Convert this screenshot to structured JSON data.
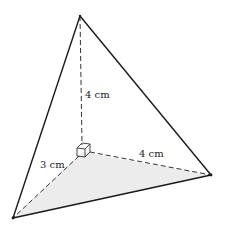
{
  "diagram": {
    "type": "triangular-pyramid",
    "vertices": {
      "apex": [
        80,
        16
      ],
      "corner": [
        82,
        152
      ],
      "bottom_left": [
        13,
        218
      ],
      "right": [
        211,
        175
      ]
    },
    "colors": {
      "edge": "#1a1a1a",
      "dashed_edge": "#333333",
      "base_fill": "#ececec",
      "label": "#222222"
    },
    "labels": {
      "height": "4 cm",
      "left_leg": "3 cm",
      "right_leg": "4 cm"
    },
    "edges": {
      "solid": [
        "apex-bottom_left",
        "apex-right",
        "bottom_left-right"
      ],
      "dashed": [
        "apex-corner",
        "corner-bottom_left",
        "corner-right"
      ]
    },
    "right_angle_marker": "cube"
  }
}
